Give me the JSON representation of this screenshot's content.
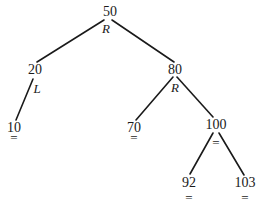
{
  "diagram": {
    "type": "avl-tree",
    "nodes": [
      {
        "id": "n50",
        "value": "50",
        "balance": "R",
        "x": 110,
        "y": 12,
        "bx": 106,
        "by": 28
      },
      {
        "id": "n20",
        "value": "20",
        "balance": "L",
        "x": 35,
        "y": 70,
        "bx": 36,
        "by": 88
      },
      {
        "id": "n80",
        "value": "80",
        "balance": "R",
        "x": 175,
        "y": 70,
        "bx": 175,
        "by": 87
      },
      {
        "id": "n10",
        "value": "10",
        "balance": "=",
        "x": 14,
        "y": 128,
        "bx": 14,
        "by": 136
      },
      {
        "id": "n70",
        "value": "70",
        "balance": "=",
        "x": 134,
        "y": 128,
        "bx": 134,
        "by": 136
      },
      {
        "id": "n100",
        "value": "100",
        "balance": "=",
        "x": 216,
        "y": 125,
        "bx": 216,
        "by": 141
      },
      {
        "id": "n92",
        "value": "92",
        "balance": "=",
        "x": 189,
        "y": 183,
        "bx": 189,
        "by": 196
      },
      {
        "id": "n103",
        "value": "103",
        "balance": "=",
        "x": 245,
        "y": 183,
        "bx": 245,
        "by": 196
      }
    ],
    "edges": [
      {
        "from": "50",
        "to": "20",
        "x1": 104,
        "y1": 20,
        "x2": 37,
        "y2": 62
      },
      {
        "from": "50",
        "to": "80",
        "x1": 112,
        "y1": 20,
        "x2": 174,
        "y2": 62
      },
      {
        "from": "20",
        "to": "10",
        "x1": 33,
        "y1": 79,
        "x2": 16,
        "y2": 120
      },
      {
        "from": "80",
        "to": "70",
        "x1": 173,
        "y1": 77,
        "x2": 136,
        "y2": 120
      },
      {
        "from": "80",
        "to": "100",
        "x1": 177,
        "y1": 77,
        "x2": 213,
        "y2": 117
      },
      {
        "from": "100",
        "to": "92",
        "x1": 213,
        "y1": 133,
        "x2": 190,
        "y2": 174
      },
      {
        "from": "100",
        "to": "103",
        "x1": 219,
        "y1": 133,
        "x2": 244,
        "y2": 175
      }
    ],
    "line_color": "#1a1a1a"
  }
}
